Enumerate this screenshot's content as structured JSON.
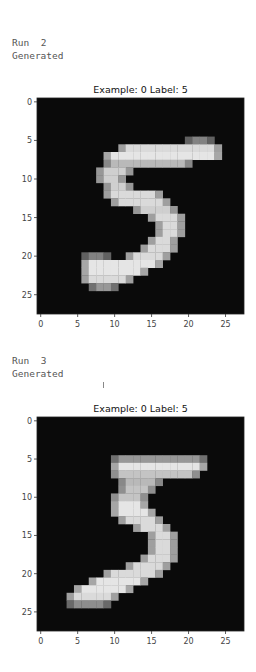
{
  "cells": [
    {
      "run_label": "Run",
      "run_number": "2",
      "status": "Generated",
      "figure": {
        "title": "Example: 0  Label: 5",
        "x_ticks": [
          "0",
          "5",
          "10",
          "15",
          "20",
          "25"
        ],
        "y_ticks": [
          "0",
          "5",
          "10",
          "15",
          "20",
          "25"
        ],
        "image_size": 28,
        "digit": "5",
        "rows": [
          [
            5,
            20,
            23,
            0.5
          ],
          [
            6,
            11,
            24,
            0.9
          ],
          [
            7,
            9,
            24,
            0.95
          ],
          [
            8,
            9,
            20,
            0.75
          ],
          [
            9,
            8,
            12,
            0.85
          ],
          [
            10,
            8,
            11,
            0.85
          ],
          [
            11,
            9,
            12,
            0.85
          ],
          [
            12,
            9,
            16,
            0.9
          ],
          [
            13,
            10,
            17,
            0.9
          ],
          [
            14,
            13,
            18,
            0.85
          ],
          [
            15,
            15,
            19,
            0.9
          ],
          [
            16,
            16,
            19,
            0.9
          ],
          [
            17,
            16,
            19,
            0.9
          ],
          [
            18,
            15,
            18,
            0.9
          ],
          [
            19,
            14,
            18,
            0.9
          ],
          [
            20,
            12,
            17,
            0.9
          ],
          [
            20,
            6,
            9,
            0.5
          ],
          [
            21,
            6,
            16,
            0.95
          ],
          [
            22,
            6,
            14,
            0.95
          ],
          [
            23,
            6,
            12,
            0.9
          ],
          [
            24,
            7,
            10,
            0.6
          ]
        ]
      }
    },
    {
      "run_label": "Run",
      "run_number": "3",
      "status": "Generated",
      "figure": {
        "title": "Example: 0  Label: 5",
        "x_ticks": [
          "0",
          "5",
          "10",
          "15",
          "20",
          "25"
        ],
        "y_ticks": [
          "0",
          "5",
          "10",
          "15",
          "20",
          "25"
        ],
        "image_size": 28,
        "digit": "5",
        "rows": [
          [
            5,
            10,
            22,
            0.6
          ],
          [
            6,
            10,
            22,
            0.95
          ],
          [
            7,
            10,
            21,
            0.8
          ],
          [
            8,
            11,
            16,
            0.75
          ],
          [
            9,
            11,
            15,
            0.8
          ],
          [
            10,
            10,
            14,
            0.8
          ],
          [
            11,
            10,
            14,
            0.95
          ],
          [
            12,
            10,
            15,
            0.95
          ],
          [
            13,
            11,
            16,
            0.9
          ],
          [
            14,
            13,
            17,
            0.9
          ],
          [
            15,
            15,
            18,
            0.9
          ],
          [
            16,
            15,
            18,
            0.9
          ],
          [
            17,
            15,
            18,
            0.9
          ],
          [
            18,
            14,
            18,
            0.9
          ],
          [
            19,
            12,
            17,
            0.9
          ],
          [
            20,
            9,
            16,
            0.9
          ],
          [
            21,
            7,
            14,
            0.95
          ],
          [
            22,
            5,
            12,
            0.95
          ],
          [
            23,
            4,
            10,
            0.9
          ],
          [
            24,
            4,
            9,
            0.55
          ]
        ]
      }
    }
  ]
}
